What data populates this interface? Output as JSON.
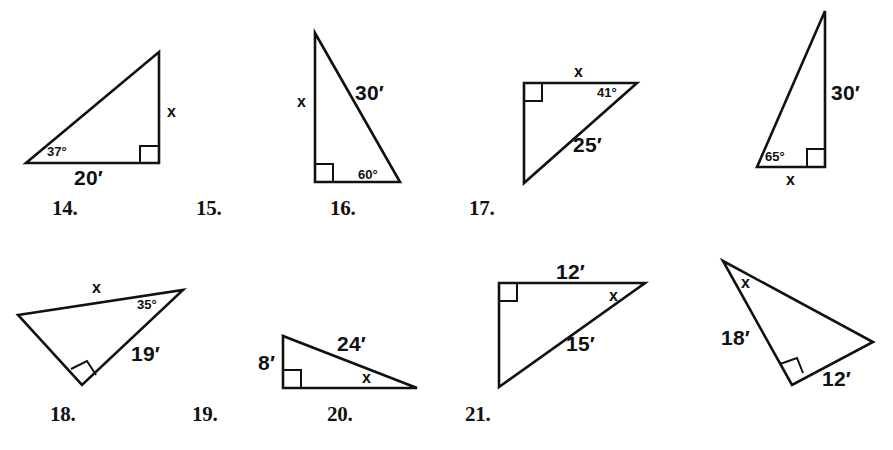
{
  "page": {
    "background_color": "#ffffff",
    "ink_color": "#111111",
    "width": 893,
    "height": 450
  },
  "figures": [
    {
      "number": "14.",
      "number_pos": [
        52,
        196
      ],
      "origin": [
        0,
        0
      ],
      "points": "26,163 159,163 159,52",
      "right_angle": "140,163 140,146 159,146",
      "labels": [
        {
          "text": "37°",
          "pos": [
            47,
            145
          ],
          "cls": "lbl-ang",
          "name": "angle-37-label"
        },
        {
          "text": "20′",
          "pos": [
            74,
            167
          ],
          "cls": "lbl-side",
          "name": "side-20-label"
        },
        {
          "text": "x",
          "pos": [
            167,
            104
          ],
          "cls": "lbl-var",
          "name": "variable-x-label"
        }
      ]
    },
    {
      "number": "15.",
      "number_pos": [
        196,
        196
      ],
      "origin": [
        0,
        0
      ],
      "points": "315,33 315,182 400,182",
      "right_angle": "315,164 333,164 333,182",
      "labels": [
        {
          "text": "x",
          "pos": [
            297,
            94
          ],
          "cls": "lbl-var",
          "name": "variable-x-label"
        },
        {
          "text": "30′",
          "pos": [
            355,
            82
          ],
          "cls": "lbl-side",
          "name": "side-30-label"
        },
        {
          "text": "60°",
          "pos": [
            358,
            168
          ],
          "cls": "lbl-ang",
          "name": "angle-60-label"
        }
      ]
    },
    {
      "number": "16.",
      "number_pos": [
        330,
        196
      ],
      "origin": [
        0,
        0
      ],
      "points": "524,83 637,83 524,183",
      "right_angle": "524,101 542,101 542,83",
      "labels": [
        {
          "text": "x",
          "pos": [
            574,
            64
          ],
          "cls": "lbl-var",
          "name": "variable-x-label"
        },
        {
          "text": "41°",
          "pos": [
            597,
            86
          ],
          "cls": "lbl-ang",
          "name": "angle-41-label"
        },
        {
          "text": "25′",
          "pos": [
            573,
            134
          ],
          "cls": "lbl-side",
          "name": "side-25-label"
        }
      ]
    },
    {
      "number": "17.",
      "number_pos": [
        469,
        196
      ],
      "origin": [
        0,
        0
      ],
      "points": "757,167 825,167 825,11",
      "right_angle": "807,167 807,149 825,149",
      "labels": [
        {
          "text": "65°",
          "pos": [
            765,
            150
          ],
          "cls": "lbl-ang",
          "name": "angle-65-label"
        },
        {
          "text": "30′",
          "pos": [
            831,
            82
          ],
          "cls": "lbl-side",
          "name": "side-30-label"
        },
        {
          "text": "x",
          "pos": [
            786,
            172
          ],
          "cls": "lbl-var",
          "name": "variable-x-label"
        }
      ]
    },
    {
      "number": "18.",
      "number_pos": [
        50,
        402
      ],
      "origin": [
        0,
        0
      ],
      "points": "18,315 183,290 82,385",
      "right_angle": "71,369 87,361 96,375",
      "labels": [
        {
          "text": "x",
          "pos": [
            92,
            280
          ],
          "cls": "lbl-var",
          "name": "variable-x-label"
        },
        {
          "text": "35°",
          "pos": [
            137,
            298
          ],
          "cls": "lbl-ang",
          "name": "angle-35-label"
        },
        {
          "text": "19′",
          "pos": [
            131,
            343
          ],
          "cls": "lbl-side",
          "name": "side-19-label"
        }
      ]
    },
    {
      "number": "19.",
      "number_pos": [
        192,
        402
      ],
      "origin": [
        0,
        0
      ],
      "points": "283,336 283,388 417,388",
      "right_angle": "283,370 301,370 301,388",
      "labels": [
        {
          "text": "8′",
          "pos": [
            258,
            352
          ],
          "cls": "lbl-side",
          "name": "side-8-label"
        },
        {
          "text": "24′",
          "pos": [
            337,
            333
          ],
          "cls": "lbl-side",
          "name": "side-24-label"
        },
        {
          "text": "x",
          "pos": [
            362,
            370
          ],
          "cls": "lbl-var",
          "name": "variable-x-label"
        }
      ]
    },
    {
      "number": "20.",
      "number_pos": [
        327,
        402
      ],
      "origin": [
        0,
        0
      ],
      "points": "499,283 645,283 499,387",
      "right_angle": "499,301 517,301 517,283",
      "labels": [
        {
          "text": "12′",
          "pos": [
            556,
            261
          ],
          "cls": "lbl-side",
          "name": "side-12-label"
        },
        {
          "text": "x",
          "pos": [
            609,
            288
          ],
          "cls": "lbl-var",
          "name": "variable-x-label"
        },
        {
          "text": "15′",
          "pos": [
            566,
            333
          ],
          "cls": "lbl-side",
          "name": "side-15-label"
        }
      ]
    },
    {
      "number": "21.",
      "number_pos": [
        465,
        402
      ],
      "origin": [
        0,
        0
      ],
      "points": "723,261 873,342 792,385",
      "right_angle": "780,364 797,358 803,373",
      "labels": [
        {
          "text": "x",
          "pos": [
            741,
            275
          ],
          "cls": "lbl-var",
          "name": "variable-x-label"
        },
        {
          "text": "18′",
          "pos": [
            721,
            327
          ],
          "cls": "lbl-side",
          "name": "side-18-label"
        },
        {
          "text": "12′",
          "pos": [
            822,
            368
          ],
          "cls": "lbl-side",
          "name": "side-12-label"
        }
      ]
    }
  ]
}
